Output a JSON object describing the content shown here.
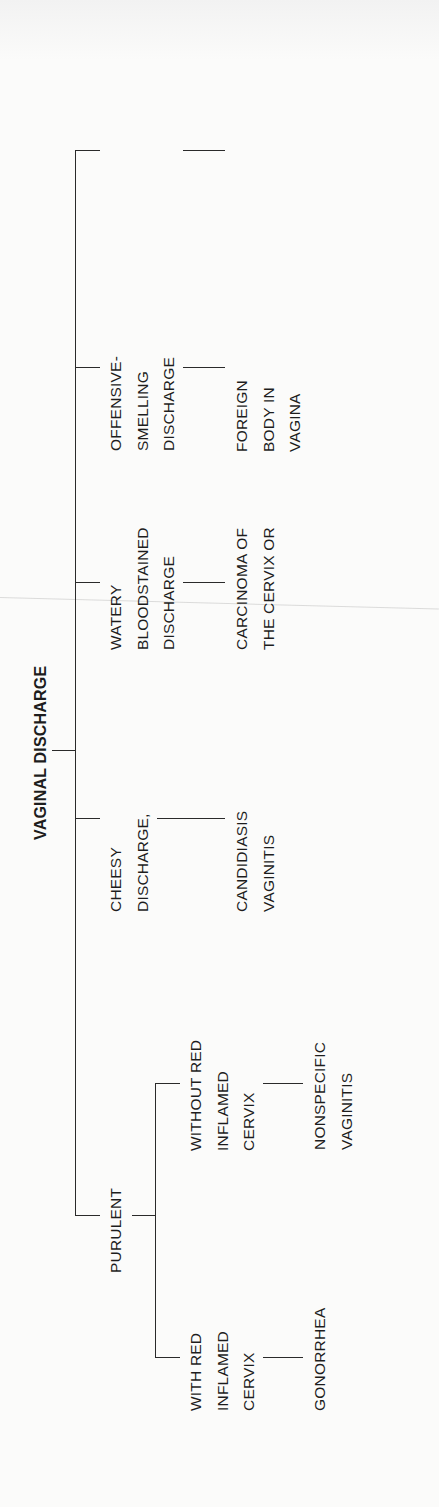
{
  "diagram": {
    "title": "VAGINAL DISCHARGE",
    "orientation": "rotated 90 degrees counter-clockwise",
    "root": {
      "label": "VAGINAL DISCHARGE",
      "children": [
        {
          "id": "purulent",
          "lines": [
            "PURULENT"
          ],
          "children": [
            {
              "id": "with-red",
              "lines": [
                "WITH RED",
                "INFLAMED",
                "CERVIX"
              ],
              "diagnosis": {
                "lines": [
                  "GONORRHEA"
                ]
              }
            },
            {
              "id": "without-red",
              "lines": [
                "WITHOUT RED",
                "INFLAMED",
                "CERVIX"
              ],
              "diagnosis": {
                "lines": [
                  "NONSPECIFIC",
                  "VAGINITIS"
                ]
              }
            }
          ]
        },
        {
          "id": "frothy",
          "lines": [
            "FROTHY YELLOW",
            "DISCHARGE"
          ],
          "diagnosis": {
            "lines": [
              "TRICHOMONIASIS",
              "VAGINITIS"
            ]
          }
        },
        {
          "id": "cheesy",
          "lines": [
            "CHEESY",
            "DISCHARGE,",
            "ITCHING"
          ],
          "diagnosis": {
            "lines": [
              "CANDIDIASIS",
              "VAGINITIS"
            ]
          }
        },
        {
          "id": "watery",
          "lines": [
            "WATERY",
            "BLOODSTAINED",
            "DISCHARGE"
          ],
          "diagnosis": {
            "lines": [
              "CARCINOMA OF",
              "THE CERVIX OR",
              "ENDOMETRIUM,",
              "POLYPS,",
              "HYDATIDIFORM",
              "MOLE, CHRONIC",
              "CERVICITIS"
            ]
          }
        },
        {
          "id": "offensive",
          "lines": [
            "OFFENSIVE-",
            "SMELLING",
            "DISCHARGE"
          ],
          "diagnosis": {
            "lines": [
              "FOREIGN",
              "BODY IN",
              "VAGINA"
            ]
          }
        }
      ]
    }
  }
}
